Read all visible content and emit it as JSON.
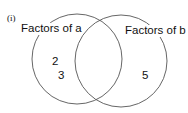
{
  "part_label": "(i)",
  "sets": {
    "a": {
      "label": "Factors of a",
      "only": [
        "2",
        "3"
      ]
    },
    "b": {
      "label": "Factors of b",
      "only": [
        "5"
      ]
    },
    "intersection": [
      "2",
      "2",
      "2"
    ]
  },
  "colors": {
    "stroke": "#555555",
    "text": "#111111"
  }
}
